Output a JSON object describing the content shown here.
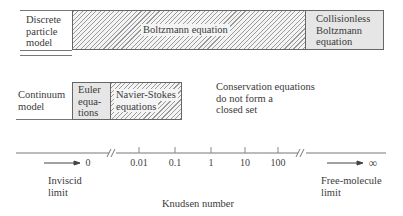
{
  "rows": {
    "discrete": {
      "label": [
        "Discrete",
        "particle",
        "model"
      ],
      "boltzmann": "Boltzmann equation",
      "collisionless": [
        "Collisionless",
        "Boltzmann",
        "equation"
      ]
    },
    "continuum": {
      "label": [
        "Continuum",
        "model"
      ],
      "euler": [
        "Euler",
        "equa-",
        "tions"
      ],
      "navier_stokes": [
        "Navier-Stokes",
        "equations"
      ],
      "note": [
        "Conservation equations",
        "do not form a",
        "closed set"
      ]
    }
  },
  "axis": {
    "title": "Knudsen number",
    "left_value": "0",
    "right_value": "∞",
    "ticks": [
      "0.01",
      "0.1",
      "1",
      "10",
      "100"
    ],
    "left_limit": [
      "Inviscid",
      "limit"
    ],
    "right_limit": [
      "Free-molecule",
      "limit"
    ]
  }
}
